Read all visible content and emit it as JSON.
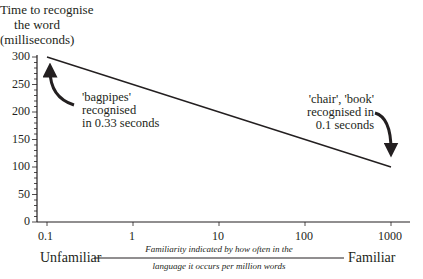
{
  "chart_data": {
    "type": "line",
    "title": "",
    "ylabel": "Time to recognise the word (milliseconds)",
    "ylabel_lines": [
      "Time to recognise",
      "the word",
      "(milliseconds)"
    ],
    "xlabel": "Familiarity indicated by how often in the language it occurs per million words",
    "xlabel_lines": [
      "Familiarity indicated by how often in the",
      "language it occurs per million words"
    ],
    "xscale": "log",
    "x_ticks": [
      "0.1",
      "1",
      "10",
      "100",
      "1000"
    ],
    "y_ticks": [
      "0",
      "50",
      "100",
      "150",
      "200",
      "250",
      "300"
    ],
    "ylim": [
      0,
      300
    ],
    "xlim": [
      0.1,
      1000
    ],
    "grid": false,
    "series": [
      {
        "name": "Recognition time",
        "x": [
          0.1,
          1000
        ],
        "y": [
          300,
          100
        ]
      }
    ],
    "annotations": [
      {
        "text_lines": [
          "'bagpipes'",
          "recognised",
          "in 0.33 seconds"
        ],
        "points_to": [
          0.1,
          300
        ]
      },
      {
        "text_lines": [
          "'chair', 'book'",
          "recognised in",
          "0.1 seconds"
        ],
        "points_to": [
          1000,
          100
        ]
      }
    ],
    "x_extremes": {
      "left": "Unfamiliar",
      "right": "Familiar"
    }
  }
}
